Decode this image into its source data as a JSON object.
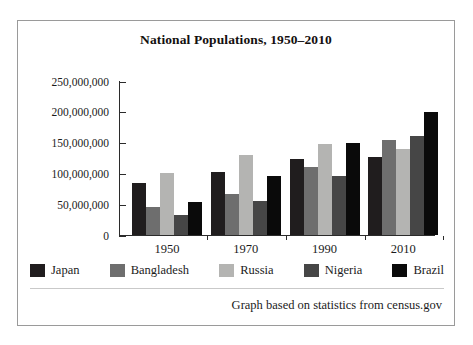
{
  "figure": {
    "caption": "Graph based on statistics from census.gov"
  },
  "chart_data": {
    "type": "bar",
    "title": "National Populations, 1950–2010",
    "xlabel": "",
    "ylabel": "",
    "categories": [
      "1950",
      "1970",
      "1990",
      "2010"
    ],
    "series": [
      {
        "name": "Japan",
        "color": "#201d1e",
        "values": [
          84000000,
          103000000,
          123000000,
          127000000
        ]
      },
      {
        "name": "Bangladesh",
        "color": "#6e6e6e",
        "values": [
          46000000,
          66000000,
          111000000,
          155000000
        ]
      },
      {
        "name": "Russia",
        "color": "#b4b4b2",
        "values": [
          101000000,
          130000000,
          147000000,
          140000000
        ]
      },
      {
        "name": "Nigeria",
        "color": "#464646",
        "values": [
          32000000,
          55000000,
          96000000,
          161000000
        ]
      },
      {
        "name": "Brazil",
        "color": "#0a0a0a",
        "values": [
          53000000,
          95000000,
          150000000,
          200000000
        ]
      }
    ],
    "ylim": [
      0,
      250000000
    ],
    "y_ticks": [
      0,
      50000000,
      100000000,
      150000000,
      200000000,
      250000000
    ],
    "y_tick_labels": [
      "0",
      "50,000,000",
      "100,000,000",
      "150,000,000",
      "200,000,000",
      "250,000,000"
    ],
    "grid": false,
    "legend_position": "bottom"
  }
}
